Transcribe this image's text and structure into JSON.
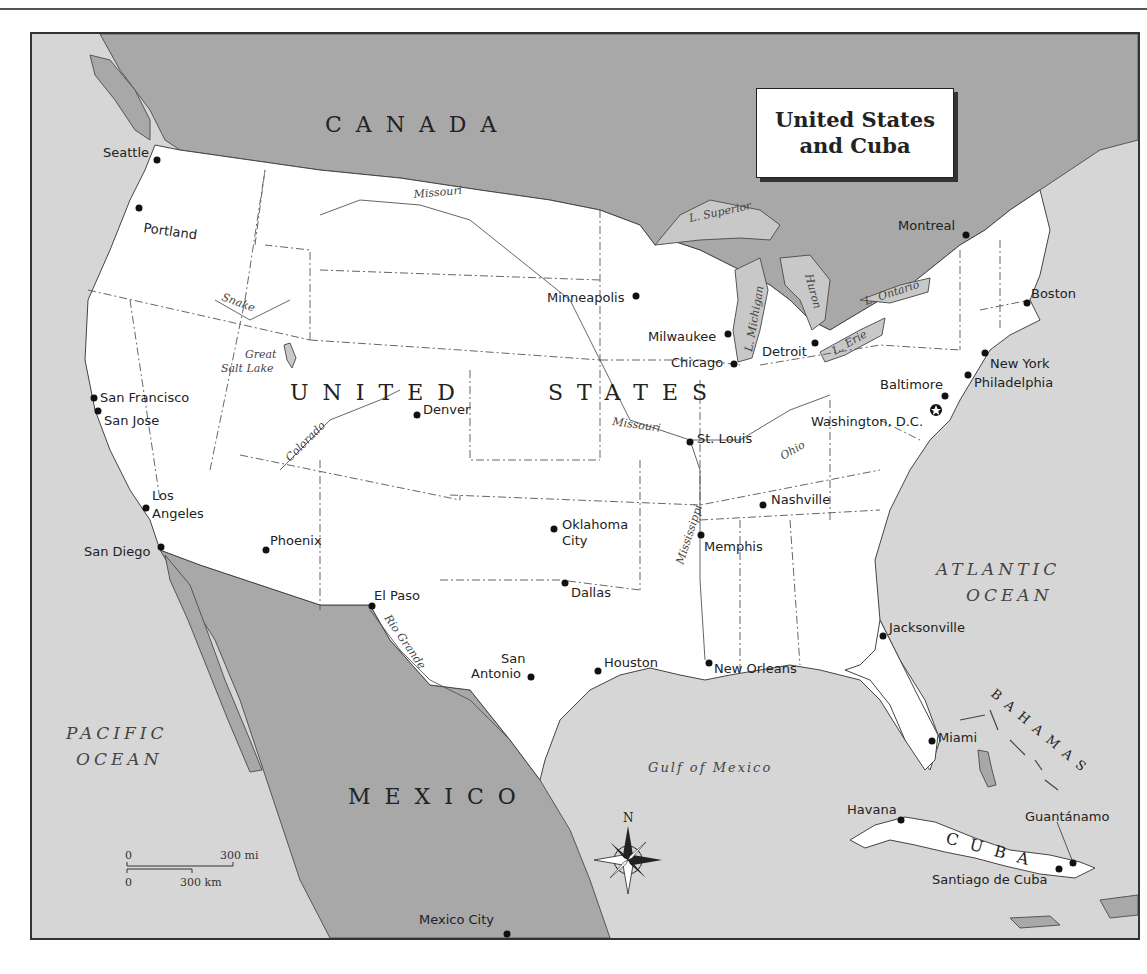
{
  "title": {
    "line1": "United States",
    "line2": "and Cuba"
  },
  "countries": {
    "canada": "CANADA",
    "usa": "UNITED STATES",
    "usa_word1": "UNITED",
    "usa_word2": "STATES",
    "mexico": "MEXICO",
    "cuba": "CUBA",
    "bahamas": "BAHAMAS"
  },
  "water": {
    "pacific_line1": "PACIFIC",
    "pacific_line2": "OCEAN",
    "atlantic_line1": "ATLANTIC",
    "atlantic_line2": "OCEAN",
    "gulf": "Gulf of Mexico",
    "lake_superior": "L. Superior",
    "lake_michigan": "L. Michigan",
    "lake_huron": "Huron",
    "lake_erie": "L. Erie",
    "lake_ontario": "L. Ontario",
    "great_salt_lake_line1": "Great",
    "great_salt_lake_line2": "Salt Lake"
  },
  "rivers": {
    "missouri_north": "Missouri",
    "missouri_south": "Missouri",
    "snake": "Snake",
    "colorado": "Colorado",
    "ohio": "Ohio",
    "mississippi": "Mississippi",
    "rio_grande": "Rio Grande"
  },
  "cities": [
    {
      "name": "Seattle",
      "x": 157,
      "y": 160
    },
    {
      "name": "Portland",
      "x": 139,
      "y": 208
    },
    {
      "name": "San Francisco",
      "x": 94,
      "y": 398
    },
    {
      "name": "San Jose",
      "x": 98,
      "y": 411
    },
    {
      "name": "Los Angeles",
      "x": 146,
      "y": 508
    },
    {
      "name": "San Diego",
      "x": 161,
      "y": 547
    },
    {
      "name": "Phoenix",
      "x": 266,
      "y": 550
    },
    {
      "name": "Denver",
      "x": 417,
      "y": 415
    },
    {
      "name": "El Paso",
      "x": 372,
      "y": 606
    },
    {
      "name": "Oklahoma City",
      "x": 554,
      "y": 529
    },
    {
      "name": "Dallas",
      "x": 565,
      "y": 583
    },
    {
      "name": "San Antonio",
      "x": 531,
      "y": 677
    },
    {
      "name": "Houston",
      "x": 598,
      "y": 671
    },
    {
      "name": "Minneapolis",
      "x": 636,
      "y": 296
    },
    {
      "name": "Milwaukee",
      "x": 728,
      "y": 334
    },
    {
      "name": "Chicago",
      "x": 734,
      "y": 364
    },
    {
      "name": "St. Louis",
      "x": 690,
      "y": 442
    },
    {
      "name": "Memphis",
      "x": 701,
      "y": 535
    },
    {
      "name": "Nashville",
      "x": 763,
      "y": 505
    },
    {
      "name": "New Orleans",
      "x": 709,
      "y": 663
    },
    {
      "name": "Detroit",
      "x": 815,
      "y": 343
    },
    {
      "name": "Montreal",
      "x": 966,
      "y": 235
    },
    {
      "name": "Boston",
      "x": 1027,
      "y": 303
    },
    {
      "name": "New York",
      "x": 985,
      "y": 353
    },
    {
      "name": "Philadelphia",
      "x": 968,
      "y": 375
    },
    {
      "name": "Baltimore",
      "x": 945,
      "y": 396
    },
    {
      "name": "Washington, D.C.",
      "x": 936,
      "y": 410
    },
    {
      "name": "Jacksonville",
      "x": 883,
      "y": 636
    },
    {
      "name": "Miami",
      "x": 932,
      "y": 741
    },
    {
      "name": "Havana",
      "x": 901,
      "y": 820
    },
    {
      "name": "Guantánamo",
      "x": 1073,
      "y": 863
    },
    {
      "name": "Santiago de Cuba",
      "x": 1059,
      "y": 869
    },
    {
      "name": "Mexico City",
      "x": 507,
      "y": 934
    }
  ],
  "scale": {
    "mi_zero": "0",
    "mi_label": "300 mi",
    "km_zero": "0",
    "km_label": "300 km"
  },
  "compass": {
    "north_label": "N"
  },
  "colors": {
    "water": "#d6d6d6",
    "land_foreign": "#a8a8a8",
    "land_usa": "#ffffff",
    "border": "#333333"
  }
}
